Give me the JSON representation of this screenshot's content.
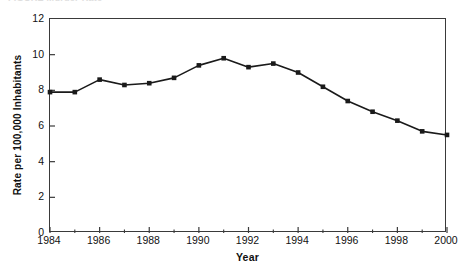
{
  "figure": {
    "caption_sliver": "FIGURE  Murder Rate"
  },
  "chart_data": {
    "type": "line",
    "title": "",
    "xlabel": "Year",
    "ylabel": "Rate per 100,000 Inhabitants",
    "x": [
      1984,
      1985,
      1986,
      1987,
      1988,
      1989,
      1990,
      1991,
      1992,
      1993,
      1994,
      1995,
      1996,
      1997,
      1998,
      1999,
      2000
    ],
    "values": [
      7.9,
      7.9,
      8.6,
      8.3,
      8.4,
      8.7,
      9.4,
      9.8,
      9.3,
      9.5,
      9.0,
      8.2,
      7.4,
      6.8,
      6.3,
      5.7,
      5.5
    ],
    "xlim": [
      1984,
      2000
    ],
    "ylim": [
      0,
      12
    ],
    "yticks": [
      0,
      2,
      4,
      6,
      8,
      10,
      12
    ],
    "ytick_labels": [
      "0",
      "2",
      "4",
      "6",
      "8",
      "10",
      "12"
    ],
    "xticks": [
      1984,
      1986,
      1988,
      1990,
      1992,
      1994,
      1996,
      1998,
      2000
    ],
    "xtick_labels": [
      "1984",
      "1986",
      "1988",
      "1990",
      "1992",
      "1994",
      "1996",
      "1998",
      "2000"
    ],
    "x_minor_ticks": [
      1985,
      1987,
      1989,
      1991,
      1993,
      1995,
      1997,
      1999
    ],
    "grid": false,
    "legend": null,
    "series_color": "#1a1a1a",
    "marker": "square",
    "line_width": 1.6,
    "marker_size": 4.6
  }
}
